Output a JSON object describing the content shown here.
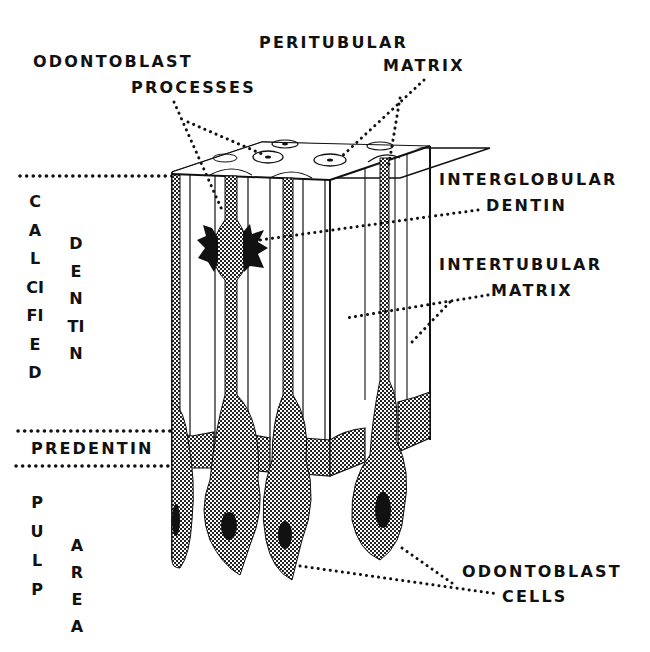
{
  "diagram": {
    "colors": {
      "ink": "#111111",
      "background": "#ffffff",
      "stipple": "#7a7a7a"
    },
    "labels": {
      "odontoblast_processes": {
        "line1": "ODONTOBLAST",
        "line2": "PROCESSES"
      },
      "peritubular_matrix": {
        "line1": "PERITUBULAR",
        "line2": "MATRIX"
      },
      "interglobular_dentin": {
        "line1": "INTERGLOBULAR",
        "line2": "DENTIN"
      },
      "intertubular_matrix": {
        "line1": "INTERTUBULAR",
        "line2": "MATRIX"
      },
      "odontoblast_cells": {
        "line1": "ODONTOBLAST",
        "line2": "CELLS"
      },
      "predentin": "PREDENTIN",
      "calcified": "CALCIFIED",
      "dentin_vertical": "DENTIN",
      "pulp": "PULP",
      "area": "AREA"
    }
  }
}
